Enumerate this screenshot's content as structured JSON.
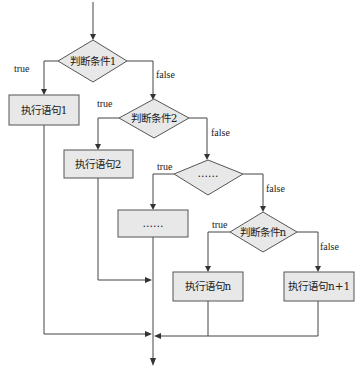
{
  "diagram": {
    "type": "flowchart",
    "title": "",
    "decisions": [
      {
        "id": "d1",
        "label": "判断条件1"
      },
      {
        "id": "d2",
        "label": "判断条件2"
      },
      {
        "id": "d3",
        "label": "……"
      },
      {
        "id": "dn",
        "label": "判断条件n"
      }
    ],
    "processes": [
      {
        "id": "p1",
        "label": "执行语句1"
      },
      {
        "id": "p2",
        "label": "执行语句2"
      },
      {
        "id": "p3",
        "label": "……"
      },
      {
        "id": "pn",
        "label": "执行语句n"
      },
      {
        "id": "pn1",
        "label": "执行语句n+1"
      }
    ],
    "edge_labels": {
      "d1_true": "true",
      "d1_false": "false",
      "d2_true": "true",
      "d2_false": "false",
      "d3_true": "true",
      "d3_false": "false",
      "dn_true": "true",
      "dn_false": "false"
    },
    "edges": [
      {
        "from": "start",
        "to": "d1"
      },
      {
        "from": "d1",
        "to": "p1",
        "label": "true"
      },
      {
        "from": "d1",
        "to": "d2",
        "label": "false"
      },
      {
        "from": "d2",
        "to": "p2",
        "label": "true"
      },
      {
        "from": "d2",
        "to": "d3",
        "label": "false"
      },
      {
        "from": "d3",
        "to": "p3",
        "label": "true"
      },
      {
        "from": "d3",
        "to": "dn",
        "label": "false"
      },
      {
        "from": "dn",
        "to": "pn",
        "label": "true"
      },
      {
        "from": "dn",
        "to": "pn1",
        "label": "false"
      },
      {
        "from": "p1",
        "to": "end"
      },
      {
        "from": "p2",
        "to": "end"
      },
      {
        "from": "p3",
        "to": "end"
      },
      {
        "from": "pn",
        "to": "end"
      },
      {
        "from": "pn1",
        "to": "end"
      }
    ]
  }
}
